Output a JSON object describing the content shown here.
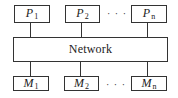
{
  "diagram": {
    "processors": [
      {
        "base": "P",
        "sub": "1"
      },
      {
        "base": "P",
        "sub": "2"
      },
      {
        "base": "P",
        "sub": "n"
      }
    ],
    "network": {
      "label": "Network"
    },
    "memories": [
      {
        "base": "M",
        "sub": "1"
      },
      {
        "base": "M",
        "sub": "2"
      },
      {
        "base": "M",
        "sub": "n"
      }
    ],
    "ellipsis": "· · ·",
    "colors": {
      "stroke": "#333333",
      "background": "#ffffff",
      "text": "#222222"
    }
  }
}
